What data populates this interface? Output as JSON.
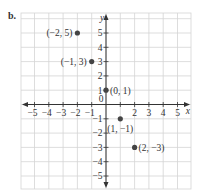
{
  "part_label": "b.",
  "axes": {
    "x_label": "x",
    "y_label": "y",
    "origin_label": "0",
    "x_ticks": [
      -5,
      -4,
      -3,
      -2,
      -1,
      1,
      2,
      3,
      4,
      5
    ],
    "y_ticks": [
      -5,
      -4,
      -3,
      -2,
      -1,
      1,
      2,
      3,
      4,
      5
    ],
    "x_tick_labels": [
      "−5",
      "−4",
      "−3",
      "−2",
      "−1",
      "2",
      "3",
      "4",
      "5"
    ],
    "y_tick_labels": [
      "5",
      "4",
      "3",
      "2",
      "1",
      "−1",
      "−2",
      "−3",
      "−4",
      "−5"
    ]
  },
  "points": [
    {
      "x": -2,
      "y": 5,
      "label": "(−2, 5)",
      "label_side": "left"
    },
    {
      "x": -1,
      "y": 3,
      "label": "(−1, 3)",
      "label_side": "left"
    },
    {
      "x": 0,
      "y": 1,
      "label": "(0, 1)",
      "label_side": "right"
    },
    {
      "x": 1,
      "y": -1,
      "label": "(1, −1)",
      "label_side": "below"
    },
    {
      "x": 2,
      "y": -3,
      "label": "(2, −3)",
      "label_side": "right"
    }
  ],
  "colors": {
    "grid": "#d4d4d4",
    "axis": "#333333",
    "point": "#444444",
    "text": "#333333"
  },
  "chart_data": {
    "type": "scatter",
    "title": "",
    "xlabel": "x",
    "ylabel": "y",
    "xlim": [
      -6,
      6
    ],
    "ylim": [
      -6,
      6
    ],
    "grid": true,
    "series": [
      {
        "name": "points",
        "x": [
          -2,
          -1,
          0,
          1,
          2
        ],
        "y": [
          5,
          3,
          1,
          -1,
          -3
        ],
        "labels": [
          "(−2, 5)",
          "(−1, 3)",
          "(0, 1)",
          "(1, −1)",
          "(2, −3)"
        ]
      }
    ]
  }
}
